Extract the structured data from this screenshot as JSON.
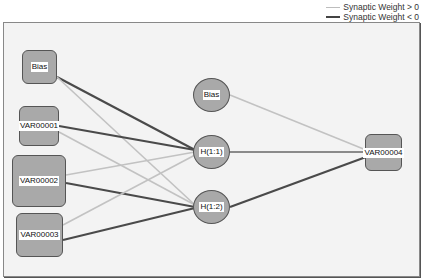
{
  "legend": {
    "items": [
      {
        "label": "Synaptic Weight > 0",
        "color": "#bdbdbd"
      },
      {
        "label": "Synaptic Weight < 0",
        "color": "#444444"
      }
    ]
  },
  "nodes": {
    "input_bias": {
      "label": "Bias",
      "x": 22,
      "y": 50,
      "w": 35,
      "h": 34,
      "shape": "box"
    },
    "var1": {
      "label": "VAR00001",
      "x": 19,
      "y": 106,
      "w": 40,
      "h": 40,
      "shape": "box"
    },
    "var2": {
      "label": "VAR00002",
      "x": 12,
      "y": 155,
      "w": 54,
      "h": 52,
      "shape": "box"
    },
    "var3": {
      "label": "VAR00003",
      "x": 16,
      "y": 213,
      "w": 47,
      "h": 44,
      "shape": "box"
    },
    "hidden_bias": {
      "label": "Bias",
      "x": 193,
      "y": 78,
      "w": 37,
      "h": 34,
      "shape": "circle"
    },
    "h11": {
      "label": "H(1:1)",
      "x": 193,
      "y": 135,
      "w": 37,
      "h": 34,
      "shape": "circle"
    },
    "h12": {
      "label": "H(1:2)",
      "x": 193,
      "y": 190,
      "w": 37,
      "h": 34,
      "shape": "circle"
    },
    "out": {
      "label": "VAR00004",
      "x": 365,
      "y": 134,
      "w": 37,
      "h": 37,
      "shape": "box"
    }
  },
  "edges": [
    {
      "from": "input_bias",
      "to": "h11",
      "sign": "negative",
      "x1": 57,
      "y1": 77,
      "x2": 195,
      "y2": 150
    },
    {
      "from": "input_bias",
      "to": "h12",
      "sign": "positive",
      "x1": 57,
      "y1": 77,
      "x2": 195,
      "y2": 205
    },
    {
      "from": "var1",
      "to": "h11",
      "sign": "negative",
      "x1": 59,
      "y1": 126,
      "x2": 195,
      "y2": 150
    },
    {
      "from": "var1",
      "to": "h12",
      "sign": "positive",
      "x1": 59,
      "y1": 132,
      "x2": 195,
      "y2": 205
    },
    {
      "from": "var2",
      "to": "h11",
      "sign": "positive",
      "x1": 66,
      "y1": 175,
      "x2": 195,
      "y2": 152
    },
    {
      "from": "var2",
      "to": "h12",
      "sign": "negative",
      "x1": 66,
      "y1": 183,
      "x2": 195,
      "y2": 207
    },
    {
      "from": "var3",
      "to": "h11",
      "sign": "positive",
      "x1": 63,
      "y1": 225,
      "x2": 195,
      "y2": 155
    },
    {
      "from": "var3",
      "to": "h12",
      "sign": "negative",
      "x1": 63,
      "y1": 240,
      "x2": 195,
      "y2": 208
    },
    {
      "from": "hidden_bias",
      "to": "out",
      "sign": "positive",
      "x1": 230,
      "y1": 95,
      "x2": 366,
      "y2": 150
    },
    {
      "from": "h11",
      "to": "out",
      "sign": "positive_mid",
      "x1": 230,
      "y1": 152,
      "x2": 366,
      "y2": 152
    },
    {
      "from": "h12",
      "to": "out",
      "sign": "negative",
      "x1": 230,
      "y1": 207,
      "x2": 366,
      "y2": 157
    }
  ],
  "colors": {
    "positive": "#c2c2c2",
    "positive_mid": "#8a8a8a",
    "negative": "#4a4a4a",
    "node_fill": "#a9a9a9",
    "background": "#f3f3f3"
  }
}
